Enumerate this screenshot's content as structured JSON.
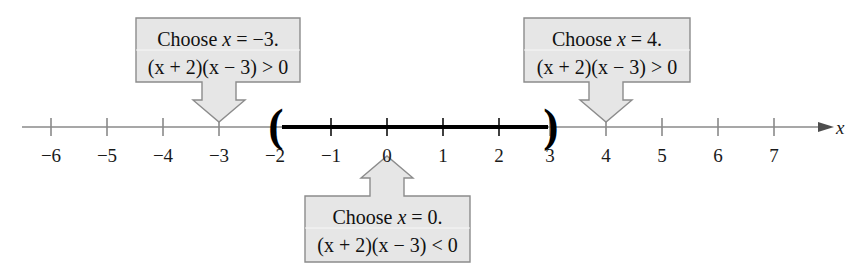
{
  "figure": {
    "type": "number-line-sign-test",
    "background_color": "#ffffff",
    "axis_variable_label": "x"
  },
  "number_line": {
    "ticks": [
      {
        "value": -6,
        "label": "−6",
        "x_px": 51
      },
      {
        "value": -5,
        "label": "−5",
        "x_px": 107
      },
      {
        "value": -4,
        "label": "−4",
        "x_px": 163
      },
      {
        "value": -3,
        "label": "−3",
        "x_px": 219
      },
      {
        "value": -2,
        "label": "−2",
        "x_px": 275
      },
      {
        "value": -1,
        "label": "−1",
        "x_px": 331
      },
      {
        "value": 0,
        "label": "0",
        "x_px": 387
      },
      {
        "value": 1,
        "label": "1",
        "x_px": 443
      },
      {
        "value": 2,
        "label": "2",
        "x_px": 499
      },
      {
        "value": 3,
        "label": "3",
        "x_px": 550
      },
      {
        "value": 4,
        "label": "4",
        "x_px": 606
      },
      {
        "value": 5,
        "label": "5",
        "x_px": 662
      },
      {
        "value": 6,
        "label": "6",
        "x_px": 718
      },
      {
        "value": 7,
        "label": "7",
        "x_px": 774
      }
    ],
    "interval": {
      "left_endpoint_value": -2,
      "right_endpoint_value": 3,
      "left_bracket_glyph": "(",
      "right_bracket_glyph": ")",
      "left_endpoint_open": true,
      "right_endpoint_open": true,
      "highlight_color": "#000000"
    },
    "axis_color": "#8a8a8a",
    "line_color": "#000000"
  },
  "callouts": [
    {
      "id": "choose-neg-3",
      "line1": "Choose x = −3.",
      "line1_prefix": "Choose ",
      "line1_var": "x",
      "line1_suffix": " = −3.",
      "line2": "(x + 2)(x − 3) > 0",
      "points_to_value": -3,
      "arrow_direction": "down",
      "fill_color": "#e6e6e6",
      "border_color": "#8c8c8c"
    },
    {
      "id": "choose-4",
      "line1": "Choose x = 4.",
      "line1_prefix": "Choose ",
      "line1_var": "x",
      "line1_suffix": " = 4.",
      "line2": "(x + 2)(x − 3) > 0",
      "points_to_value": 4,
      "arrow_direction": "down",
      "fill_color": "#e6e6e6",
      "border_color": "#8c8c8c"
    },
    {
      "id": "choose-0",
      "line1": "Choose x = 0.",
      "line1_prefix": "Choose ",
      "line1_var": "x",
      "line1_suffix": " = 0.",
      "line2": "(x + 2)(x − 3) < 0",
      "points_to_value": 0,
      "arrow_direction": "up",
      "fill_color": "#e6e6e6",
      "border_color": "#8c8c8c"
    }
  ]
}
